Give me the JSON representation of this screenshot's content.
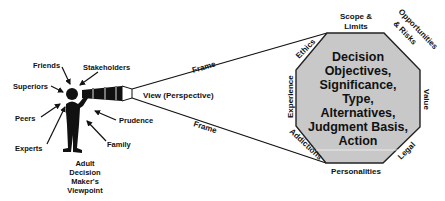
{
  "diagram": {
    "viewer": {
      "label_lines": [
        "Adult",
        "Decision",
        "Maker's",
        "Viewpoint"
      ]
    },
    "influences": [
      {
        "id": "friends",
        "label": "Friends"
      },
      {
        "id": "stakeholders",
        "label": "Stakeholders"
      },
      {
        "id": "superiors",
        "label": "Superiors"
      },
      {
        "id": "peers",
        "label": "Peers"
      },
      {
        "id": "experts",
        "label": "Experts"
      },
      {
        "id": "prudence",
        "label": "Prudence"
      },
      {
        "id": "family",
        "label": "Family"
      }
    ],
    "view_label": "View (Perspective)",
    "frame_top_label": "Frame",
    "frame_bottom_label": "Frame",
    "octagon": {
      "fill": "#c8c8c8",
      "center_lines": [
        "Decision",
        "Objectives,",
        "Significance,",
        "Type,",
        "Alternatives,",
        "Judgment Basis,",
        "Action"
      ],
      "edges": {
        "top": [
          "Scope &",
          "Limits"
        ],
        "top_right": [
          "Opportunities",
          "& Risks"
        ],
        "right": "Value",
        "bottom_right": "Legal",
        "bottom": "Personalities",
        "bottom_left": "Addictions",
        "left": "Experience",
        "top_left": "Ethics"
      }
    }
  }
}
